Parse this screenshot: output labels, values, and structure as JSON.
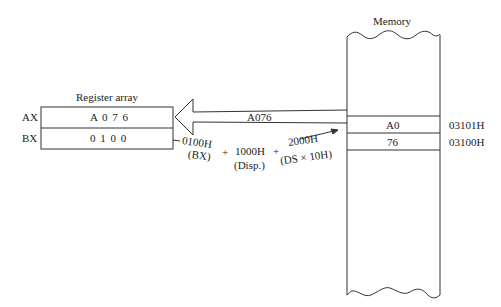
{
  "register_array": {
    "title": "Register array",
    "rows": [
      {
        "name": "AX",
        "value": "A 0 7 6"
      },
      {
        "name": "BX",
        "value": "0 1 0 0"
      }
    ]
  },
  "memory": {
    "title": "Memory",
    "cells": [
      {
        "value": "A0",
        "address": "03101H"
      },
      {
        "value": "76",
        "address": "03100H"
      }
    ]
  },
  "transfer_arrow": {
    "label": "A076"
  },
  "address_calc": {
    "terms": [
      {
        "value": "0100H",
        "source": "(BX)"
      },
      {
        "value": "1000H",
        "source": "(Disp.)"
      },
      {
        "value": "2000H",
        "source": "(DS × 10H)"
      }
    ],
    "operators": [
      "+",
      "+"
    ]
  }
}
